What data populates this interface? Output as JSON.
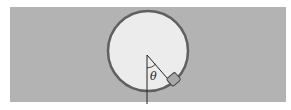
{
  "diagram": {
    "background_band": {
      "color": "#b3b3b3"
    },
    "circle": {
      "fill": "#ececec",
      "stroke": "#606060"
    },
    "block": {
      "fill": "#a8a8a8",
      "stroke": "#444444"
    },
    "angle_label": "θ",
    "line_color": "#222222"
  }
}
